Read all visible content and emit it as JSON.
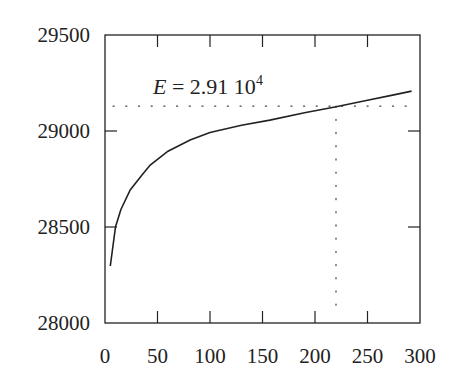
{
  "chart_data": {
    "type": "line",
    "title": "",
    "xlabel": "",
    "ylabel": "",
    "xlim": [
      0,
      300
    ],
    "ylim": [
      28000,
      29500
    ],
    "x_ticks": [
      0,
      50,
      100,
      150,
      200,
      250,
      300
    ],
    "y_ticks": [
      28000,
      28500,
      29000,
      29500
    ],
    "x_tick_labels": [
      "0",
      "50",
      "100",
      "150",
      "200",
      "250",
      "300"
    ],
    "y_tick_labels": [
      "28000",
      "28500",
      "29000",
      "29500"
    ],
    "grid": false,
    "legend": null,
    "series": [
      {
        "name": "E",
        "x": [
          5,
          10,
          15,
          24,
          35,
          43,
          60,
          81,
          100,
          130,
          157,
          190,
          219,
          250,
          275,
          292
        ],
        "y": [
          28297,
          28500,
          28590,
          28693,
          28770,
          28823,
          28895,
          28953,
          28992,
          29030,
          29057,
          29095,
          29125,
          29160,
          29188,
          29208
        ]
      }
    ],
    "reference_lines": [
      {
        "orientation": "horizontal",
        "value": 29130,
        "style": "dotted"
      },
      {
        "orientation": "vertical",
        "value": 220,
        "style": "dotted",
        "from": 28000,
        "to": 29130
      }
    ],
    "annotations": [
      {
        "text": "E = 2.91 10^4",
        "x": 70,
        "y": 29270
      }
    ]
  },
  "annotation": {
    "lhs": "E",
    "eq": " = 2.91 10",
    "exp": "4"
  }
}
